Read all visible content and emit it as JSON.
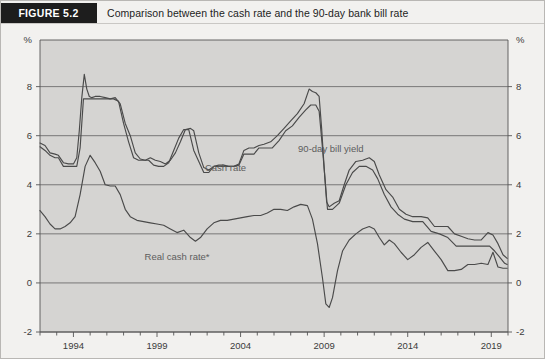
{
  "header": {
    "figure_tag": "FIGURE 5.2",
    "title": "Comparison between the cash rate and the 90-day bank bill rate",
    "tag_bg": "#1d1d1d",
    "tag_color": "#ffffff"
  },
  "chart_data": {
    "type": "line",
    "title": "Comparison between the cash rate and the 90-day bank bill rate",
    "xlabel": "",
    "ylabel": "%",
    "y_unit_label": "%",
    "xlim": [
      1992.0,
      2020.0
    ],
    "ylim": [
      -2,
      9.9
    ],
    "yticks": [
      -2,
      0,
      2,
      4,
      6,
      8
    ],
    "ytick_labels": [
      "-2",
      "0",
      "2",
      "4",
      "6",
      "8"
    ],
    "xticks": [
      1994,
      1999,
      2004,
      2009,
      2014,
      2019
    ],
    "xtick_labels": [
      "1994",
      "1999",
      "2004",
      "2009",
      "2014",
      "2019"
    ],
    "minor_xtick_step": 1,
    "grid": "horizontal",
    "grid_color": "#6d6d6d",
    "plot_bg": "#d5d4d2",
    "line_color": "#4a4a4a",
    "legend": "inline-annotations",
    "annotations": [
      {
        "text": "Cash rate",
        "x": 2003.1,
        "y": 4.55
      },
      {
        "text": "90-day bill yield",
        "x": 2009.4,
        "y": 5.35
      },
      {
        "text": "Real cash rate*",
        "x": 2000.2,
        "y": 0.95
      }
    ],
    "footnote": "*",
    "series": [
      {
        "name": "90-day bill yield",
        "x": [
          1992.0,
          1992.3,
          1992.6,
          1992.9,
          1993.1,
          1993.4,
          1993.7,
          1994.0,
          1994.2,
          1994.35,
          1994.5,
          1994.65,
          1994.8,
          1994.95,
          1995.1,
          1995.3,
          1995.6,
          1995.9,
          1996.2,
          1996.5,
          1996.8,
          1997.1,
          1997.4,
          1997.7,
          1998.0,
          1998.3,
          1998.6,
          1998.9,
          1999.2,
          1999.5,
          1999.8,
          2000.1,
          2000.4,
          2000.7,
          2001.0,
          2001.2,
          2001.5,
          2001.8,
          2002.1,
          2002.4,
          2002.7,
          2003.0,
          2003.3,
          2003.6,
          2003.9,
          2004.2,
          2004.5,
          2004.8,
          2005.1,
          2005.4,
          2005.8,
          2006.2,
          2006.6,
          2007.0,
          2007.4,
          2007.8,
          2008.1,
          2008.3,
          2008.5,
          2008.7,
          2008.85,
          2009.0,
          2009.15,
          2009.3,
          2009.6,
          2009.9,
          2010.2,
          2010.5,
          2010.9,
          2011.3,
          2011.7,
          2012.0,
          2012.3,
          2012.7,
          2013.1,
          2013.5,
          2013.9,
          2014.3,
          2014.8,
          2015.2,
          2015.6,
          2016.0,
          2016.4,
          2016.8,
          2017.2,
          2017.6,
          2018.0,
          2018.4,
          2018.8,
          2019.1,
          2019.4,
          2019.7,
          2019.95
        ],
        "y": [
          5.7,
          5.6,
          5.3,
          5.25,
          5.2,
          4.9,
          4.85,
          4.85,
          5.1,
          6.2,
          7.55,
          8.5,
          7.9,
          7.6,
          7.55,
          7.6,
          7.6,
          7.55,
          7.5,
          7.55,
          7.3,
          6.5,
          6.0,
          5.3,
          5.05,
          5.0,
          5.1,
          5.0,
          4.95,
          4.85,
          5.0,
          5.3,
          5.75,
          6.25,
          6.3,
          6.2,
          5.3,
          4.7,
          4.6,
          4.75,
          4.8,
          4.8,
          4.75,
          4.75,
          4.85,
          5.4,
          5.5,
          5.5,
          5.6,
          5.65,
          5.75,
          6.0,
          6.3,
          6.6,
          6.9,
          7.3,
          7.9,
          7.8,
          7.75,
          7.6,
          6.3,
          4.7,
          3.3,
          3.1,
          3.25,
          3.35,
          4.0,
          4.6,
          4.95,
          5.0,
          5.1,
          4.95,
          4.4,
          3.8,
          3.5,
          3.0,
          2.8,
          2.7,
          2.7,
          2.65,
          2.3,
          2.3,
          2.3,
          2.0,
          1.9,
          1.8,
          1.75,
          1.75,
          2.05,
          1.95,
          1.6,
          1.15,
          1.0
        ]
      },
      {
        "name": "Cash rate",
        "x": [
          1992.0,
          1992.3,
          1992.6,
          1992.9,
          1993.1,
          1993.4,
          1993.7,
          1994.0,
          1994.2,
          1994.4,
          1994.6,
          1994.8,
          1995.0,
          1995.2,
          1995.5,
          1995.8,
          1996.1,
          1996.4,
          1996.7,
          1997.0,
          1997.3,
          1997.6,
          1997.9,
          1998.2,
          1998.5,
          1998.8,
          1999.1,
          1999.4,
          1999.7,
          2000.0,
          2000.3,
          2000.6,
          2000.9,
          2001.2,
          2001.5,
          2001.8,
          2002.1,
          2002.4,
          2002.7,
          2003.0,
          2003.3,
          2003.6,
          2003.9,
          2004.2,
          2004.5,
          2004.8,
          2005.1,
          2005.5,
          2005.9,
          2006.3,
          2006.7,
          2007.1,
          2007.5,
          2007.9,
          2008.2,
          2008.5,
          2008.7,
          2008.9,
          2009.05,
          2009.2,
          2009.5,
          2009.9,
          2010.3,
          2010.7,
          2011.1,
          2011.5,
          2011.9,
          2012.2,
          2012.6,
          2013.0,
          2013.4,
          2013.8,
          2014.3,
          2014.9,
          2015.4,
          2015.9,
          2016.4,
          2016.9,
          2017.4,
          2017.9,
          2018.4,
          2018.9,
          2019.2,
          2019.5,
          2019.8,
          2019.95
        ],
        "y": [
          5.55,
          5.4,
          5.2,
          5.1,
          5.1,
          4.75,
          4.75,
          4.75,
          4.75,
          5.5,
          7.5,
          7.5,
          7.5,
          7.5,
          7.5,
          7.5,
          7.5,
          7.5,
          7.4,
          6.5,
          5.75,
          5.1,
          5.0,
          5.0,
          5.0,
          4.8,
          4.75,
          4.75,
          4.9,
          5.4,
          5.9,
          6.25,
          6.25,
          5.4,
          4.95,
          4.5,
          4.5,
          4.75,
          4.75,
          4.75,
          4.75,
          4.75,
          4.8,
          5.25,
          5.25,
          5.25,
          5.5,
          5.5,
          5.5,
          5.8,
          6.2,
          6.4,
          6.75,
          7.05,
          7.25,
          7.25,
          7.0,
          5.5,
          4.25,
          3.0,
          3.0,
          3.25,
          4.0,
          4.5,
          4.75,
          4.75,
          4.6,
          4.25,
          3.6,
          3.1,
          2.8,
          2.6,
          2.5,
          2.5,
          2.1,
          2.0,
          1.85,
          1.5,
          1.5,
          1.5,
          1.5,
          1.5,
          1.3,
          1.05,
          0.8,
          0.75
        ]
      },
      {
        "name": "Real cash rate*",
        "x": [
          1992.0,
          1992.3,
          1992.6,
          1992.9,
          1993.2,
          1993.5,
          1993.8,
          1994.1,
          1994.4,
          1994.7,
          1995.0,
          1995.3,
          1995.6,
          1995.9,
          1996.2,
          1996.5,
          1996.8,
          1997.1,
          1997.4,
          1997.8,
          1998.2,
          1998.6,
          1999.0,
          1999.4,
          1999.8,
          2000.2,
          2000.6,
          2001.0,
          2001.3,
          2001.6,
          2002.0,
          2002.4,
          2002.8,
          2003.2,
          2003.6,
          2004.0,
          2004.4,
          2004.8,
          2005.2,
          2005.6,
          2006.0,
          2006.4,
          2006.8,
          2007.2,
          2007.6,
          2008.0,
          2008.3,
          2008.6,
          2008.9,
          2009.1,
          2009.3,
          2009.5,
          2009.8,
          2010.1,
          2010.5,
          2010.9,
          2011.3,
          2011.7,
          2012.0,
          2012.3,
          2012.6,
          2012.9,
          2013.2,
          2013.6,
          2014.0,
          2014.4,
          2014.8,
          2015.2,
          2015.6,
          2016.0,
          2016.4,
          2016.8,
          2017.2,
          2017.6,
          2018.0,
          2018.4,
          2018.8,
          2019.1,
          2019.4,
          2019.7,
          2019.95
        ],
        "y": [
          2.95,
          2.7,
          2.4,
          2.2,
          2.2,
          2.3,
          2.45,
          2.7,
          3.6,
          4.75,
          5.2,
          4.9,
          4.55,
          4.0,
          3.95,
          3.95,
          3.6,
          3.0,
          2.7,
          2.55,
          2.5,
          2.45,
          2.4,
          2.35,
          2.2,
          2.05,
          2.15,
          1.85,
          1.7,
          1.85,
          2.2,
          2.45,
          2.55,
          2.55,
          2.6,
          2.65,
          2.7,
          2.75,
          2.75,
          2.85,
          3.0,
          3.0,
          2.95,
          3.1,
          3.2,
          3.15,
          2.6,
          1.6,
          0.2,
          -0.85,
          -1.0,
          -0.6,
          0.5,
          1.3,
          1.75,
          2.0,
          2.2,
          2.3,
          2.2,
          1.85,
          1.55,
          1.75,
          1.6,
          1.25,
          0.95,
          1.15,
          1.45,
          1.65,
          1.3,
          0.95,
          0.5,
          0.5,
          0.55,
          0.75,
          0.75,
          0.8,
          0.75,
          1.25,
          0.65,
          0.6,
          0.6
        ]
      }
    ]
  }
}
